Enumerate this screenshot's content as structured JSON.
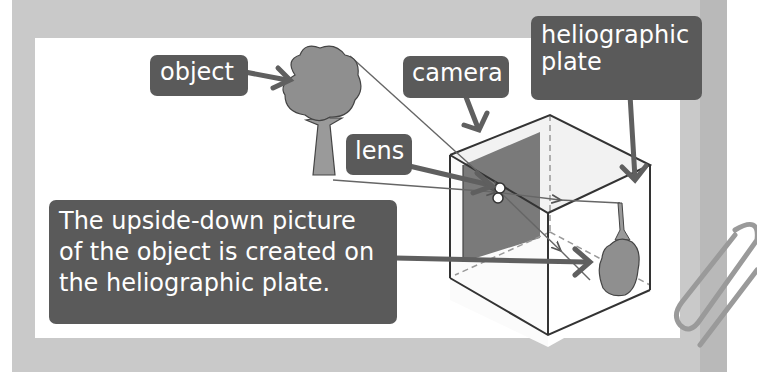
{
  "diagram": {
    "labels": {
      "object": "object",
      "camera": "camera",
      "plate": "heliographic\nplate",
      "lens": "lens",
      "caption": "The upside-down picture\nof the object is created on\nthe heliographic plate."
    },
    "colors": {
      "label_bg": "#5a5a5a",
      "label_text": "#ffffff",
      "arrow": "#5f5f5f",
      "frame": "#c9c9c9",
      "panel": "#ffffff",
      "tree": "#8f8f8f",
      "box_dark_face": "#777777"
    }
  }
}
